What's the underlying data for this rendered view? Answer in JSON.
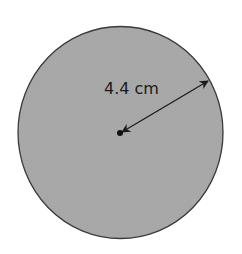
{
  "figure": {
    "type": "circle-radius-diagram",
    "shape": "circle",
    "radius_label": "4.4 cm",
    "colors": {
      "fill": "#a9a9a9",
      "outline": "#3a3a3a",
      "arrow": "#1a1a1a",
      "background": "#ffffff"
    }
  }
}
